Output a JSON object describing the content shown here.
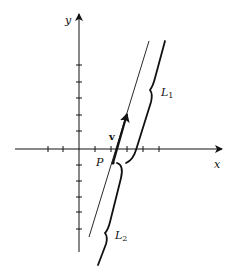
{
  "diagram": {
    "type": "coordinate-plane-lines",
    "axes": {
      "x_label": "x",
      "y_label": "y",
      "x_ticks": 7,
      "y_ticks": 10
    },
    "point": {
      "label": "P"
    },
    "vector": {
      "label": "v"
    },
    "lines": [
      {
        "label": "L",
        "subscript": "1",
        "description": "upper portion of thick line, beyond P along v"
      },
      {
        "label": "L",
        "subscript": "2",
        "description": "lower portion of thick line, before P"
      }
    ],
    "colors": {
      "ink": "#111111",
      "background": "#ffffff"
    }
  }
}
